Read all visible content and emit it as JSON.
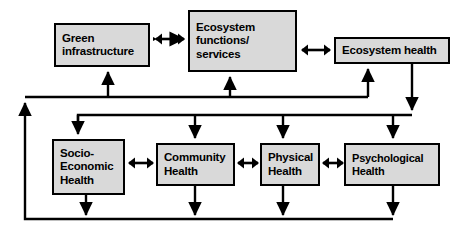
{
  "diagram": {
    "type": "conceptual-flow-diagram",
    "title": "",
    "style": {
      "box_fill": "#d9d9d9",
      "box_border": "#000000",
      "arrow_color": "#000000",
      "background": "#ffffff"
    },
    "nodes": [
      {
        "id": "green-infrastructure",
        "label": "Green\ninfrastructure",
        "row": "top",
        "x": 54,
        "y": 23,
        "w": 96,
        "h": 44
      },
      {
        "id": "ecosystem-functions-services",
        "label": "Ecosystem\nfunctions/\nservices",
        "row": "top",
        "x": 188,
        "y": 10,
        "w": 109,
        "h": 62
      },
      {
        "id": "ecosystem-health",
        "label": "Ecosystem health",
        "row": "top",
        "x": 334,
        "y": 37,
        "w": 116,
        "h": 27
      },
      {
        "id": "socio-economic-health",
        "label": "Socio-\nEconomic\nHealth",
        "row": "bottom",
        "x": 52,
        "y": 139,
        "w": 73,
        "h": 56
      },
      {
        "id": "community-health",
        "label": "Community\nHealth",
        "row": "bottom",
        "x": 156,
        "y": 143,
        "w": 79,
        "h": 43
      },
      {
        "id": "physical-health",
        "label": "Physical\nHealth",
        "row": "bottom",
        "x": 260,
        "y": 143,
        "w": 60,
        "h": 43
      },
      {
        "id": "psychological-health",
        "label": "Psychological\nHealth",
        "row": "bottom",
        "x": 344,
        "y": 143,
        "w": 96,
        "h": 43
      }
    ],
    "bidirectional_links": [
      {
        "id": "green-infra-to-ecosystem-functions",
        "from": "green-infrastructure",
        "to": "ecosystem-functions-services",
        "x": 155,
        "y": 38,
        "w": 30
      },
      {
        "id": "ecosystem-functions-to-ecosystem-health",
        "from": "ecosystem-functions-services",
        "to": "ecosystem-health",
        "x": 301,
        "y": 38,
        "w": 30
      },
      {
        "id": "socio-economic-to-community",
        "from": "socio-economic-health",
        "to": "community-health",
        "x": 128,
        "y": 160,
        "w": 25
      },
      {
        "id": "community-to-physical",
        "from": "community-health",
        "to": "physical-health",
        "x": 237,
        "y": 160,
        "w": 21
      },
      {
        "id": "physical-to-psychological",
        "from": "physical-health",
        "to": "psychological-health",
        "x": 322,
        "y": 160,
        "w": 20
      }
    ],
    "feedback_loops": [
      {
        "id": "bottom-outputs-to-upper-bus",
        "description": "outputs of health row return via bottom bus and left riser to upper bus"
      },
      {
        "id": "upper-bus-to-top-row",
        "description": "upper bus feeds Green infrastructure, Ecosystem functions/services and Ecosystem health"
      },
      {
        "id": "ecosystem-health-to-health-row",
        "description": "Ecosystem health feeds distribution bus into all four health boxes"
      }
    ]
  }
}
